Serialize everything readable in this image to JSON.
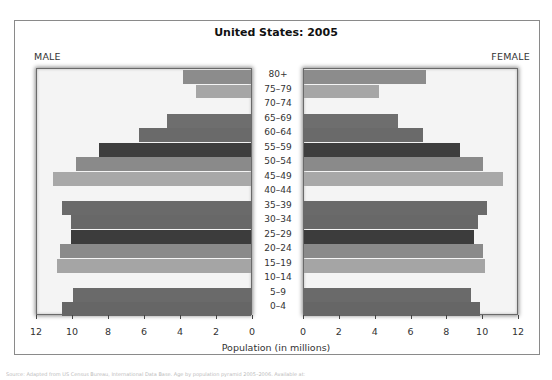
{
  "chart_data": {
    "type": "bar",
    "subtype": "population-pyramid",
    "title": "United States: 2005",
    "xlabel": "Population (in millions)",
    "ylabel": "",
    "left_label": "MALE",
    "right_label": "FEMALE",
    "xlim": [
      0,
      12
    ],
    "xticks": [
      0,
      2,
      4,
      6,
      8,
      10,
      12
    ],
    "categories": [
      "80+",
      "75–79",
      "70–74",
      "65–69",
      "60–64",
      "55–59",
      "50–54",
      "45–49",
      "40–44",
      "35–39",
      "30–34",
      "25–29",
      "20–24",
      "15–19",
      "10–14",
      "5–9",
      "0–4"
    ],
    "series": [
      {
        "name": "MALE",
        "values": [
          3.8,
          3.1,
          null,
          4.7,
          6.3,
          8.5,
          9.8,
          11.1,
          null,
          10.6,
          10.1,
          10.1,
          10.7,
          10.9,
          null,
          10.0,
          10.6
        ]
      },
      {
        "name": "FEMALE",
        "values": [
          6.9,
          4.2,
          null,
          5.3,
          6.7,
          8.8,
          10.1,
          11.2,
          null,
          10.3,
          9.8,
          9.6,
          10.1,
          10.2,
          null,
          9.4,
          9.9
        ]
      }
    ],
    "bar_colors": [
      "#8c8c8c",
      "#a6a6a6",
      "#f4f4f4",
      "#6e6e6e",
      "#6a6a6a",
      "#3e3e3e",
      "#8a8a8a",
      "#a8a8a8",
      "#f4f4f4",
      "#6a6a6a",
      "#686868",
      "#3c3c3c",
      "#8a8a8a",
      "#a5a5a5",
      "#f4f4f4",
      "#6a6a6a",
      "#666666"
    ],
    "grid": false,
    "legend": "none"
  },
  "source_text": "Source: Adapted from US Census Bureau, International Data Base. Age by population pyramid 2005–2006. Available at:"
}
